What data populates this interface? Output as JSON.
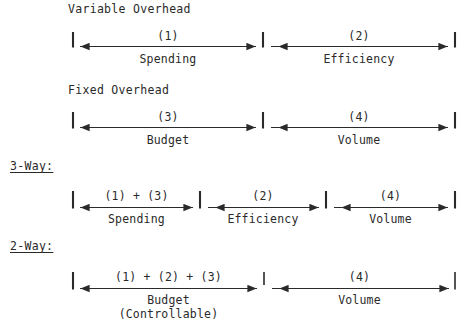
{
  "page": {
    "width": 465,
    "height": 328,
    "background": "#ffffff",
    "ink": "#2a2a2a"
  },
  "rows": [
    {
      "id": "variable-overhead",
      "title": "Variable Overhead",
      "title_x": 68,
      "title_y": 3,
      "line_y": 46,
      "tick_top": 32,
      "x_start": 73,
      "x_end": 455,
      "dividers": [
        263
      ],
      "segments": [
        {
          "code": "(1)",
          "name": "Spending",
          "x0": 73,
          "x1": 263
        },
        {
          "code": "(2)",
          "name": "Efficiency",
          "x0": 263,
          "x1": 455
        }
      ]
    },
    {
      "id": "fixed-overhead",
      "title": "Fixed Overhead",
      "title_x": 68,
      "title_y": 84,
      "line_y": 127,
      "tick_top": 112,
      "x_start": 73,
      "x_end": 455,
      "dividers": [
        263
      ],
      "segments": [
        {
          "code": "(3)",
          "name": "Budget",
          "x0": 73,
          "x1": 263
        },
        {
          "code": "(4)",
          "name": "Volume",
          "x0": 263,
          "x1": 455
        }
      ]
    },
    {
      "id": "three-way",
      "title": "3-Way:",
      "title_underlined": true,
      "title_x": 10,
      "title_y": 160,
      "line_y": 207,
      "tick_top": 191,
      "x_start": 73,
      "x_end": 455,
      "dividers": [
        200,
        326
      ],
      "segments": [
        {
          "code": "(1) + (3)",
          "name": "Spending",
          "x0": 73,
          "x1": 200
        },
        {
          "code": "(2)",
          "name": "Efficiency",
          "x0": 200,
          "x1": 326
        },
        {
          "code": "(4)",
          "name": "Volume",
          "x0": 326,
          "x1": 455
        }
      ]
    },
    {
      "id": "two-way",
      "title": "2-Way:",
      "title_underlined": true,
      "title_x": 10,
      "title_y": 240,
      "line_y": 288,
      "tick_top": 272,
      "x_start": 73,
      "x_end": 455,
      "dividers": [
        264
      ],
      "segments": [
        {
          "code": "(1) + (2) + (3)",
          "name": "Budget",
          "name2": "(Controllable)",
          "x0": 73,
          "x1": 264
        },
        {
          "code": "(4)",
          "name": "Volume",
          "x0": 264,
          "x1": 455
        }
      ]
    }
  ],
  "labels": {
    "variable_overhead": "Variable Overhead",
    "fixed_overhead": "Fixed Overhead",
    "three_way": "3-Way:",
    "two_way": "2-Way:",
    "code_1": "(1)",
    "code_2": "(2)",
    "code_3": "(3)",
    "code_4": "(4)",
    "code_1_3": "(1) + (3)",
    "code_1_2_3": "(1) + (2) + (3)",
    "spending": "Spending",
    "efficiency": "Efficiency",
    "budget": "Budget",
    "volume": "Volume",
    "controllable": "(Controllable)"
  }
}
